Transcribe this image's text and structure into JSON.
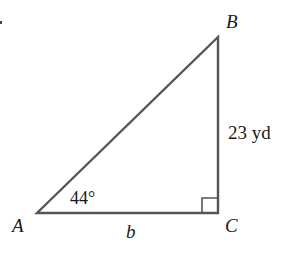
{
  "diagram": {
    "type": "right-triangle",
    "vertices": {
      "A": {
        "label": "A",
        "x": 37,
        "y": 213
      },
      "B": {
        "label": "B",
        "x": 218,
        "y": 37
      },
      "C": {
        "label": "C",
        "x": 218,
        "y": 213
      }
    },
    "labels": {
      "vertex_a": "A",
      "vertex_b": "B",
      "vertex_c": "C",
      "side_bc": "23 yd",
      "side_ac": "b",
      "angle_a": "44°"
    },
    "right_angle_at": "C",
    "colors": {
      "stroke": "#555555",
      "text": "#1a1a1a",
      "background": "#ffffff"
    }
  }
}
